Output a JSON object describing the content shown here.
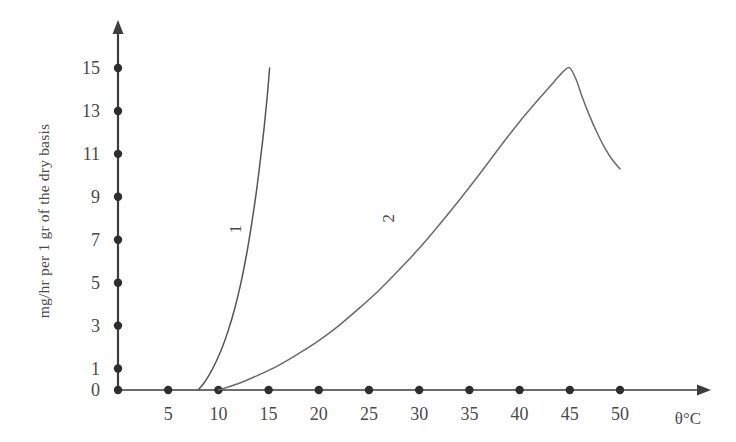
{
  "chart_data": {
    "type": "line",
    "title": "",
    "subtitle": "",
    "xlabel": "θ°C",
    "ylabel": "mg/hr per 1 gr of the dry basis",
    "xlim": [
      0,
      52
    ],
    "ylim": [
      0,
      16.5
    ],
    "grid": false,
    "legend_position": "inline-curve-labels",
    "x_ticks": [
      5,
      10,
      15,
      20,
      25,
      30,
      35,
      40,
      45,
      50
    ],
    "x_tick_labels": [
      "5",
      "10",
      "15",
      "20",
      "25",
      "30",
      "35",
      "40",
      "45",
      "50"
    ],
    "y_ticks": [
      0,
      1,
      3,
      5,
      7,
      9,
      11,
      13,
      15
    ],
    "y_tick_labels": [
      "0",
      "1",
      "3",
      "5",
      "7",
      "9",
      "11",
      "13",
      "15"
    ],
    "series": [
      {
        "name": "1",
        "label": "1",
        "color": "#555555",
        "points": [
          [
            8.0,
            0.0
          ],
          [
            8.6,
            0.35
          ],
          [
            9.2,
            0.8
          ],
          [
            9.8,
            1.35
          ],
          [
            10.4,
            2.0
          ],
          [
            11.0,
            2.8
          ],
          [
            11.6,
            3.75
          ],
          [
            12.2,
            4.9
          ],
          [
            12.8,
            6.3
          ],
          [
            13.3,
            7.7
          ],
          [
            13.8,
            9.3
          ],
          [
            14.2,
            10.8
          ],
          [
            14.55,
            12.2
          ],
          [
            14.85,
            13.6
          ],
          [
            15.1,
            15.0
          ]
        ]
      },
      {
        "name": "2",
        "label": "2",
        "color": "#6a6a6a",
        "points": [
          [
            10.0,
            0.0
          ],
          [
            12.0,
            0.3
          ],
          [
            14.0,
            0.7
          ],
          [
            16.0,
            1.15
          ],
          [
            18.0,
            1.7
          ],
          [
            20.0,
            2.3
          ],
          [
            22.0,
            3.0
          ],
          [
            24.0,
            3.8
          ],
          [
            26.0,
            4.65
          ],
          [
            28.0,
            5.6
          ],
          [
            30.0,
            6.6
          ],
          [
            32.0,
            7.7
          ],
          [
            34.0,
            8.85
          ],
          [
            36.0,
            10.05
          ],
          [
            38.0,
            11.3
          ],
          [
            40.0,
            12.5
          ],
          [
            42.0,
            13.6
          ],
          [
            43.5,
            14.4
          ],
          [
            44.5,
            14.9
          ],
          [
            45.0,
            15.0
          ],
          [
            45.6,
            14.5
          ],
          [
            46.2,
            13.7
          ],
          [
            46.9,
            12.85
          ],
          [
            47.6,
            12.1
          ],
          [
            48.4,
            11.35
          ],
          [
            49.2,
            10.75
          ],
          [
            50.0,
            10.3
          ]
        ]
      }
    ],
    "annotations": [
      {
        "text": "1",
        "x": 12.3,
        "y": 7.5,
        "rotation": -90
      },
      {
        "text": "2",
        "x": 27.5,
        "y": 8.0,
        "rotation": -90
      }
    ]
  },
  "axes": {
    "x_axis_name": "theta-axis",
    "y_axis_name": "value-axis",
    "x_arrow": true,
    "y_arrow": true
  }
}
